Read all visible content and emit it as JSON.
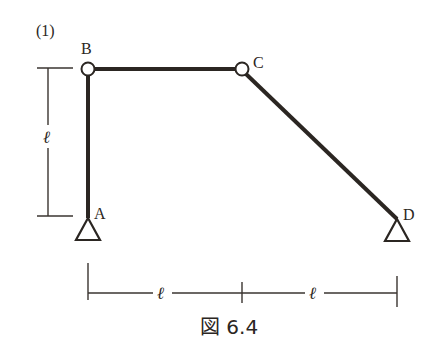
{
  "figure": {
    "problem_number": "(1)",
    "caption": "図 6.4",
    "nodes": {
      "A": {
        "label": "A",
        "x": 88,
        "y": 217,
        "type": "pin-support"
      },
      "B": {
        "label": "B",
        "x": 88,
        "y": 69,
        "type": "hinge"
      },
      "C": {
        "label": "C",
        "x": 242,
        "y": 69,
        "type": "hinge"
      },
      "D": {
        "label": "D",
        "x": 397,
        "y": 218,
        "type": "pin-support"
      }
    },
    "members": [
      {
        "from": "A",
        "to": "B",
        "label": "AB"
      },
      {
        "from": "B",
        "to": "C",
        "label": "BC"
      },
      {
        "from": "C",
        "to": "D",
        "label": "CD"
      }
    ],
    "dimensions": {
      "vertical": {
        "label": "ℓ",
        "span": "A–B"
      },
      "horizontal_left": {
        "label": "ℓ",
        "span": "A–C"
      },
      "horizontal_right": {
        "label": "ℓ",
        "span": "C–D"
      }
    }
  },
  "colors": {
    "ink": "#2b2622",
    "background": "#ffffff"
  }
}
